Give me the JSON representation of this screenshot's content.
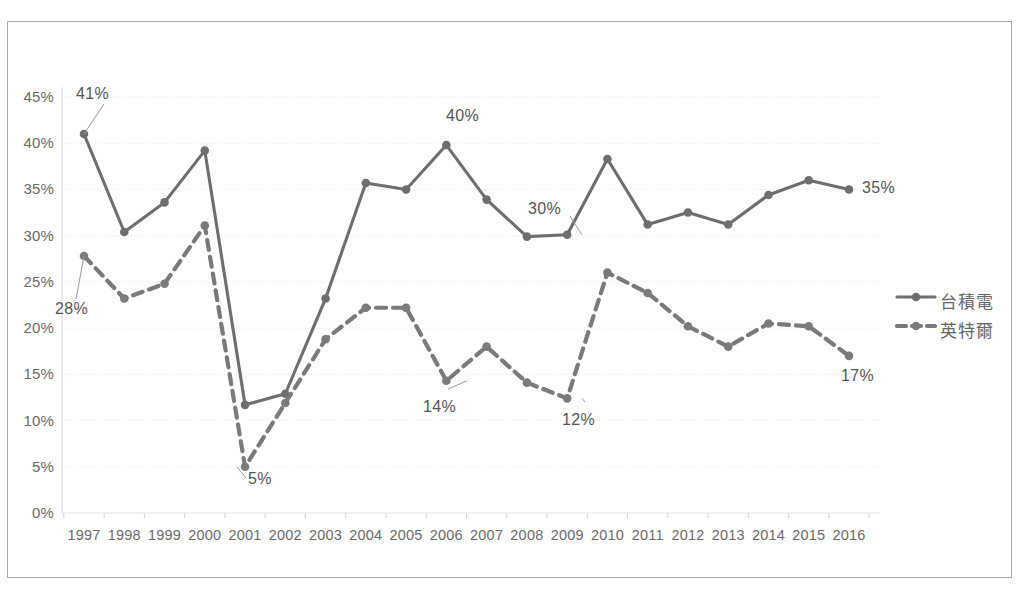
{
  "chart_data": {
    "type": "line",
    "title": "",
    "subtitle": "",
    "xlabel": "",
    "ylabel": "",
    "ylim": [
      0,
      45
    ],
    "ytick_labels": [
      "0%",
      "5%",
      "10%",
      "15%",
      "20%",
      "25%",
      "30%",
      "35%",
      "40%",
      "45%"
    ],
    "ytick_values": [
      0,
      5,
      10,
      15,
      20,
      25,
      30,
      35,
      40,
      45
    ],
    "grid": true,
    "legend_position": "right",
    "categories": [
      "1997",
      "1998",
      "1999",
      "2000",
      "2001",
      "2002",
      "2003",
      "2004",
      "2005",
      "2006",
      "2007",
      "2008",
      "2009",
      "2010",
      "2011",
      "2012",
      "2013",
      "2014",
      "2015",
      "2016"
    ],
    "series": [
      {
        "name": "台積電",
        "style": "solid",
        "color": "#6e6e6e",
        "values": [
          41.0,
          30.4,
          33.6,
          39.2,
          11.7,
          12.9,
          23.2,
          35.7,
          35.0,
          39.8,
          33.9,
          29.9,
          30.1,
          38.3,
          31.2,
          32.5,
          31.2,
          34.4,
          36.0,
          35.0
        ]
      },
      {
        "name": "英特爾",
        "style": "dashed",
        "color": "#7a7a7a",
        "values": [
          27.8,
          23.2,
          24.8,
          31.1,
          5.0,
          11.9,
          18.8,
          22.2,
          22.2,
          14.3,
          18.0,
          14.1,
          12.4,
          26.0,
          23.8,
          20.2,
          18.0,
          20.5,
          20.2,
          17.0
        ]
      }
    ],
    "annotations": [
      {
        "text": "41%",
        "series": "台積電",
        "category": "1997",
        "value": 41.0
      },
      {
        "text": "28%",
        "series": "英特爾",
        "category": "1997",
        "value": 27.8
      },
      {
        "text": "5%",
        "series": "英特爾",
        "category": "2001",
        "value": 5.0
      },
      {
        "text": "40%",
        "series": "台積電",
        "category": "2006",
        "value": 39.8
      },
      {
        "text": "30%",
        "series": "台積電",
        "category": "2009",
        "value": 30.1
      },
      {
        "text": "14%",
        "series": "英特爾",
        "category": "2006",
        "value": 14.3
      },
      {
        "text": "12%",
        "series": "英特爾",
        "category": "2009",
        "value": 12.4
      },
      {
        "text": "35%",
        "series": "台積電",
        "category": "2016",
        "value": 35.0
      },
      {
        "text": "17%",
        "series": "英特爾",
        "category": "2016",
        "value": 17.0
      }
    ]
  },
  "axes": {
    "y_ticks": [
      {
        "label": "45%"
      },
      {
        "label": "40%"
      },
      {
        "label": "35%"
      },
      {
        "label": "30%"
      },
      {
        "label": "25%"
      },
      {
        "label": "20%"
      },
      {
        "label": "15%"
      },
      {
        "label": "10%"
      },
      {
        "label": "5%"
      },
      {
        "label": "0%"
      }
    ],
    "x_ticks": [
      {
        "label": "1997"
      },
      {
        "label": "1998"
      },
      {
        "label": "1999"
      },
      {
        "label": "2000"
      },
      {
        "label": "2001"
      },
      {
        "label": "2002"
      },
      {
        "label": "2003"
      },
      {
        "label": "2004"
      },
      {
        "label": "2005"
      },
      {
        "label": "2006"
      },
      {
        "label": "2007"
      },
      {
        "label": "2008"
      },
      {
        "label": "2009"
      },
      {
        "label": "2010"
      },
      {
        "label": "2011"
      },
      {
        "label": "2012"
      },
      {
        "label": "2013"
      },
      {
        "label": "2014"
      },
      {
        "label": "2015"
      },
      {
        "label": "2016"
      }
    ]
  },
  "legend": {
    "entries": [
      {
        "label": "台積電",
        "style": "solid"
      },
      {
        "label": "英特爾",
        "style": "dashed"
      }
    ]
  },
  "callouts": [
    {
      "text": "41%"
    },
    {
      "text": "28%"
    },
    {
      "text": "5%"
    },
    {
      "text": "40%"
    },
    {
      "text": "30%"
    },
    {
      "text": "14%"
    },
    {
      "text": "12%"
    },
    {
      "text": "35%"
    },
    {
      "text": "17%"
    }
  ],
  "colors": {
    "line": "#6e6e6e",
    "grid": "#dfe3ea",
    "axis_text": "#6a6a6a",
    "border": "#a8a8a8",
    "background": "#ffffff"
  }
}
